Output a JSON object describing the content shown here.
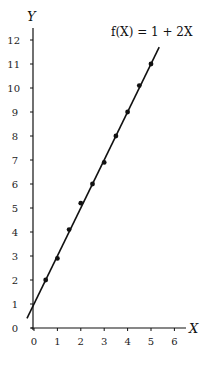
{
  "chart_data": {
    "type": "scatter",
    "title": "",
    "xlabel": "X",
    "ylabel": "Y",
    "xlim": [
      0,
      6.5
    ],
    "ylim": [
      0,
      12.5
    ],
    "grid": false,
    "x_ticks": [
      0,
      1,
      2,
      3,
      4,
      5,
      6
    ],
    "y_ticks": [
      0,
      1,
      2,
      3,
      4,
      5,
      6,
      7,
      8,
      9,
      10,
      11,
      12
    ],
    "series": [
      {
        "name": "observations",
        "type": "scatter",
        "x": [
          0.5,
          1.0,
          1.5,
          2.0,
          2.5,
          3.0,
          3.5,
          4.0,
          4.5,
          5.0
        ],
        "y": [
          2.0,
          2.9,
          4.1,
          5.2,
          6.0,
          6.9,
          8.0,
          9.0,
          10.1,
          11.0
        ]
      },
      {
        "name": "f(X) = 1 + 2X",
        "type": "line",
        "intercept": 1,
        "slope": 2,
        "x_range": [
          -0.3,
          5.35
        ]
      }
    ],
    "annotations": [
      {
        "text": "f(X) = 1 + 2X",
        "position": "top-right, near line end"
      }
    ]
  },
  "labels": {
    "x_axis": "X",
    "y_axis": "Y",
    "equation": "f(X) = 1 + 2X"
  }
}
